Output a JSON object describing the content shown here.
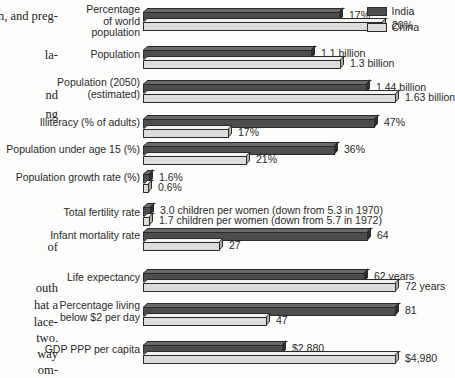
{
  "legend": {
    "entries": [
      {
        "name": "India",
        "color": "#4d4d4d"
      },
      {
        "name": "China",
        "color": "#dcdcda"
      }
    ]
  },
  "margin_text": {
    "lines": [
      "en, and preg-",
      "la-",
      "nd",
      "ng",
      "of",
      "outh",
      "hat a",
      "lace-",
      "two.",
      "way",
      "om-"
    ]
  },
  "chart_data": {
    "type": "bar",
    "orientation": "horizontal",
    "title": "",
    "xlabel": "",
    "ylabel": "",
    "grid": false,
    "legend_position": "top-right",
    "categories": [
      "Percentage\nof world\npopulation",
      "Population",
      "Population (2050)\n(estimated)",
      "Illiteracy (% of adults)",
      "Population under age 15 (%)",
      "Population growth rate (%)",
      "Total fertility rate",
      "Infant mortality rate",
      "Life expectancy",
      "Percentage living\nbelow $2 per day",
      "GDP PPP per capita"
    ],
    "series": [
      {
        "name": "India",
        "color": "#4d4d4d",
        "values": [
          17,
          1.1,
          1.44,
          47,
          36,
          1.6,
          3.0,
          64,
          62,
          81,
          2880
        ],
        "labels": [
          "17%",
          "1.1 billion",
          "1.44 billion",
          "47%",
          "36%",
          "1.6%",
          "3.0 children per women (down from 5.3 in 1970)",
          "64",
          "62 years",
          "81",
          "$2,880"
        ]
      },
      {
        "name": "China",
        "color": "#dcdcda",
        "values": [
          20,
          1.3,
          1.63,
          17,
          21,
          0.6,
          1.7,
          27,
          72,
          47,
          4980
        ],
        "labels": [
          "20%",
          "1.3 billion",
          "1.63 billion",
          "17%",
          "21%",
          "0.6%",
          "1.7 children per women (down from 5.7 in 1972)",
          "27",
          "72 years",
          "47",
          "$4,980"
        ]
      }
    ]
  }
}
